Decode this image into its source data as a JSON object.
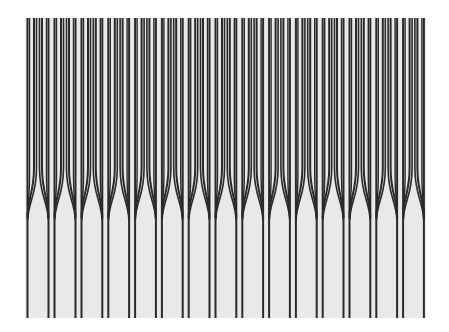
{
  "figure": {
    "background_color": "#ffffff",
    "panel_color": "#e9e9e9",
    "line_color": "#2a2a2a",
    "bounds": {
      "left": 25,
      "right": 426,
      "top": 18,
      "bottom": 318
    },
    "fork_pitch": 26.8,
    "fork_centers": [
      24.5,
      51.5,
      78.5,
      105.3,
      132.1,
      158.9,
      185.7,
      212.5,
      239.3,
      266.1,
      292.9,
      319.7,
      346.5,
      373.3,
      400.1,
      426.9
    ],
    "merge_start_y": 168,
    "merge_end_y": 218
  }
}
